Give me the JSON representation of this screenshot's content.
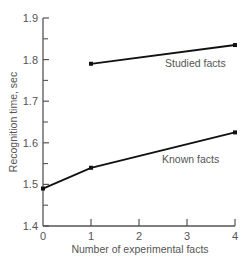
{
  "chart_data": {
    "type": "line",
    "title": "",
    "xlabel": "Number of experimental facts",
    "ylabel": "Recognition time, sec",
    "xlim": [
      0,
      4
    ],
    "ylim": [
      1.4,
      1.9
    ],
    "x_ticks": [
      "0",
      "1",
      "2",
      "3",
      "4"
    ],
    "y_ticks": [
      "1.4",
      "1.5",
      "1.6",
      "1.7",
      "1.8",
      "1.9"
    ],
    "grid": false,
    "legend": "inline labels",
    "series": [
      {
        "name": "Studied facts",
        "x": [
          1,
          4
        ],
        "values": [
          1.79,
          1.835
        ]
      },
      {
        "name": "Known facts",
        "x": [
          0,
          1,
          4
        ],
        "values": [
          1.49,
          1.54,
          1.625
        ]
      }
    ]
  },
  "colors": {
    "axis": "#555555",
    "line": "#111111",
    "text": "#555555"
  }
}
